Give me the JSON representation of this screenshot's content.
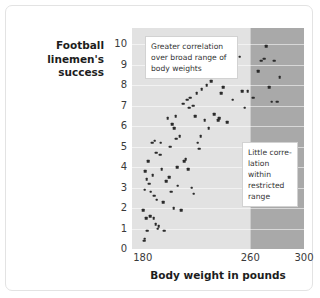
{
  "figure": {
    "y_axis_title": "Football linemen's success",
    "x_axis_title": "Body weight in pounds",
    "annotations": {
      "broad": "Greater correlation over broad range of body weights",
      "restricted": "Little corre-lation within restricted range"
    }
  },
  "chart_data": {
    "type": "scatter",
    "title": "",
    "xlabel": "Body weight in pounds",
    "ylabel": "Football linemen's success",
    "xlim": [
      172,
      300
    ],
    "ylim": [
      0,
      10.8
    ],
    "xticks": [
      180,
      260,
      300
    ],
    "yticks": [
      0,
      1,
      2,
      3,
      4,
      5,
      6,
      7,
      8,
      9,
      10
    ],
    "grid": true,
    "legend": null,
    "annotations": [
      {
        "text": "Greater correlation over broad range of body weights",
        "region": "broad-range",
        "x_range": [
          172,
          260
        ]
      },
      {
        "text": "Little corre-lation within restricted range",
        "region": "restricted-range",
        "x_range": [
          260,
          300
        ]
      }
    ],
    "shaded_bands": [
      {
        "name": "broad-range",
        "x_range": [
          172,
          260
        ],
        "color": "#e2e2e2"
      },
      {
        "name": "restricted-range",
        "x_range": [
          260,
          300
        ],
        "color": "#a9a9a9"
      }
    ],
    "points": [
      [
        180.5,
        1.9
      ],
      [
        181.0,
        0.4
      ],
      [
        181.5,
        0.5
      ],
      [
        181.5,
        2.9
      ],
      [
        182.0,
        3.8
      ],
      [
        182.5,
        1.5
      ],
      [
        183.0,
        3.4
      ],
      [
        183.5,
        0.9
      ],
      [
        184.0,
        4.3
      ],
      [
        185.0,
        3.2
      ],
      [
        185.5,
        1.6
      ],
      [
        186.0,
        2.8
      ],
      [
        187.0,
        5.2
      ],
      [
        187.5,
        3.6
      ],
      [
        188.0,
        1.5
      ],
      [
        188.5,
        2.6
      ],
      [
        189.0,
        5.3
      ],
      [
        189.5,
        1.2
      ],
      [
        190.0,
        4.7
      ],
      [
        190.5,
        2.4
      ],
      [
        191.0,
        1.0
      ],
      [
        192.0,
        1.1
      ],
      [
        193.0,
        4.6
      ],
      [
        193.5,
        5.2
      ],
      [
        194.0,
        3.9
      ],
      [
        195.0,
        2.3
      ],
      [
        196.0,
        0.9
      ],
      [
        197.5,
        3.3
      ],
      [
        198.5,
        6.4
      ],
      [
        199.5,
        3.5
      ],
      [
        200.5,
        5.0
      ],
      [
        201.0,
        2.8
      ],
      [
        202.0,
        6.1
      ],
      [
        203.0,
        2.0
      ],
      [
        203.5,
        5.9
      ],
      [
        204.5,
        6.5
      ],
      [
        205.0,
        5.4
      ],
      [
        205.5,
        4.0
      ],
      [
        206.0,
        3.1
      ],
      [
        207.5,
        5.5
      ],
      [
        208.5,
        1.9
      ],
      [
        210.0,
        7.1
      ],
      [
        211.0,
        4.3
      ],
      [
        212.0,
        4.4
      ],
      [
        213.0,
        7.3
      ],
      [
        214.0,
        3.9
      ],
      [
        214.5,
        6.9
      ],
      [
        215.5,
        7.4
      ],
      [
        216.5,
        3.0
      ],
      [
        217.5,
        7.0
      ],
      [
        218.0,
        2.7
      ],
      [
        219.0,
        6.5
      ],
      [
        220.0,
        7.6
      ],
      [
        221.0,
        5.2
      ],
      [
        222.0,
        4.9
      ],
      [
        223.0,
        5.5
      ],
      [
        224.0,
        7.8
      ],
      [
        226.0,
        6.3
      ],
      [
        227.5,
        8.0
      ],
      [
        229.0,
        5.9
      ],
      [
        231.0,
        8.2
      ],
      [
        233.0,
        6.6
      ],
      [
        236.0,
        6.3
      ],
      [
        237.0,
        6.4
      ],
      [
        238.5,
        7.6
      ],
      [
        240.0,
        7.9
      ],
      [
        241.5,
        9.0
      ],
      [
        243.0,
        6.2
      ],
      [
        245.0,
        8.9
      ],
      [
        247.0,
        7.3
      ],
      [
        250.0,
        8.5
      ],
      [
        252.0,
        9.4
      ],
      [
        254.0,
        7.7
      ],
      [
        256.0,
        6.9
      ],
      [
        258.0,
        7.7
      ],
      [
        262.0,
        7.4
      ],
      [
        266.0,
        8.7
      ],
      [
        268.0,
        9.2
      ],
      [
        270.5,
        9.3
      ],
      [
        272.0,
        9.9
      ],
      [
        274.0,
        7.9
      ],
      [
        276.0,
        7.2
      ],
      [
        278.0,
        9.2
      ],
      [
        280.0,
        7.2
      ],
      [
        282.0,
        8.4
      ]
    ]
  }
}
